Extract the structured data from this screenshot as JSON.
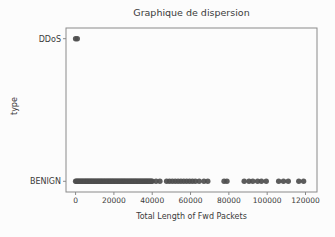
{
  "chart_data": {
    "type": "scatter",
    "title": "Graphique de dispersion",
    "xlabel": "Total Length of Fwd Packets",
    "ylabel": "type",
    "x_ticks": [
      0,
      20000,
      40000,
      60000,
      80000,
      100000,
      120000
    ],
    "y_categories": [
      "BENIGN",
      "DDoS"
    ],
    "xlim": [
      -5000,
      126000
    ],
    "ylim": [
      -0.075,
      1.075
    ],
    "grid": false,
    "legend": "none",
    "point_color": "#4e4e4e",
    "axis_color": "#8a8a8a",
    "series": [
      {
        "name": "DDoS",
        "category": "DDoS",
        "x": [
          0,
          900
        ]
      },
      {
        "name": "BENIGN",
        "category": "BENIGN",
        "x": [
          0,
          500,
          1000,
          1500,
          2000,
          2500,
          3000,
          3500,
          4000,
          4500,
          5000,
          5500,
          6000,
          6500,
          7000,
          7500,
          8000,
          8500,
          9000,
          9500,
          10000,
          10500,
          11000,
          11500,
          12000,
          12500,
          13000,
          13500,
          14000,
          14500,
          15000,
          15500,
          16000,
          16500,
          17000,
          17500,
          18000,
          18500,
          19000,
          19500,
          20000,
          20500,
          21000,
          21500,
          22000,
          22500,
          23000,
          23500,
          24000,
          24500,
          25000,
          25500,
          26000,
          26500,
          27000,
          27500,
          28000,
          28500,
          29000,
          29500,
          30000,
          30500,
          31000,
          31500,
          32000,
          32500,
          33000,
          33500,
          34000,
          34500,
          35000,
          35500,
          36000,
          36500,
          37000,
          37500,
          38000,
          38500,
          39000,
          39500,
          40000,
          42000,
          44000,
          47500,
          49000,
          50500,
          52000,
          53500,
          55000,
          56500,
          58000,
          59500,
          61000,
          62500,
          64500,
          67000,
          69000,
          77500,
          79000,
          88000,
          90500,
          92500,
          95000,
          97000,
          99500,
          106000,
          108500,
          111000,
          116500,
          119000
        ]
      }
    ]
  }
}
